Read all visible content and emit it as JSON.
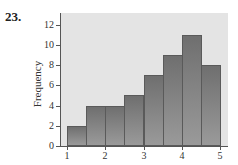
{
  "problem_label": "23.",
  "chart_data": {
    "type": "bar",
    "subtype": "histogram",
    "title": "",
    "xlabel": "",
    "ylabel": "Frequency",
    "bin_edges": [
      1.0,
      1.5,
      2.0,
      2.5,
      3.0,
      3.5,
      4.0,
      4.5,
      5.0
    ],
    "categories": [
      "1.0-1.5",
      "1.5-2.0",
      "2.0-2.5",
      "2.5-3.0",
      "3.0-3.5",
      "3.5-4.0",
      "4.0-4.5",
      "4.5-5.0"
    ],
    "values": [
      2,
      4,
      4,
      5,
      7,
      9,
      11,
      8
    ],
    "xlim": [
      0.85,
      5.25
    ],
    "ylim": [
      0,
      13
    ],
    "x_ticks": [
      "1",
      "2",
      "3",
      "4",
      "5"
    ],
    "y_ticks": [
      "0",
      "2",
      "4",
      "6",
      "8",
      "10",
      "12"
    ],
    "grid": false,
    "legend": null,
    "colors": {
      "plot_background": "#e4e4e4",
      "bar_fill": "#858585",
      "bar_edge": "#5a5a5a"
    }
  }
}
